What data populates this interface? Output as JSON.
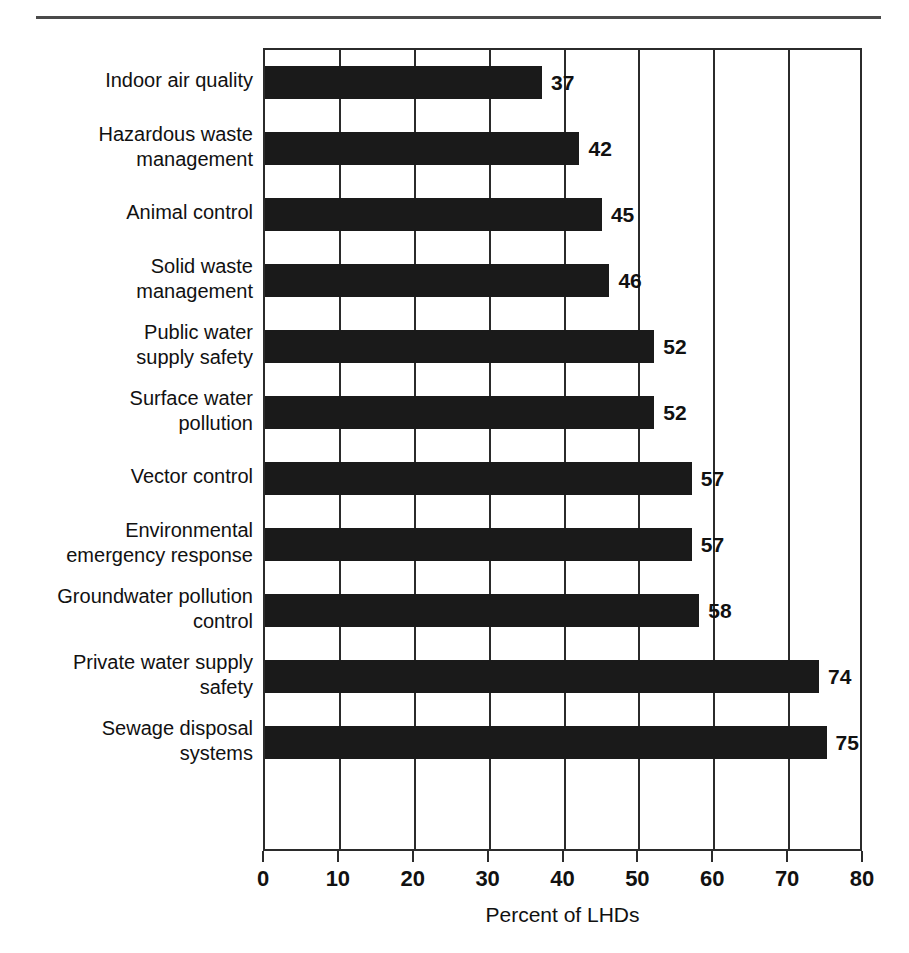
{
  "page": {
    "background_color": "#ffffff",
    "rule_color": "#4a4a4a"
  },
  "chart_data": {
    "type": "bar",
    "orientation": "horizontal",
    "title": "",
    "subtitle": "",
    "xlabel": "Percent of LHDs",
    "ylabel": "",
    "xlim": [
      0,
      80
    ],
    "xticks": [
      0,
      10,
      20,
      30,
      40,
      50,
      60,
      70,
      80
    ],
    "xtick_labels": [
      "0",
      "10",
      "20",
      "30",
      "40",
      "50",
      "60",
      "70",
      "80"
    ],
    "grid": true,
    "grid_axis": "x",
    "legend": false,
    "legend_position": "none",
    "bar_color": "#1a1a1a",
    "axis_color": "#2b2b2b",
    "value_labels": true,
    "categories": [
      "Indoor air quality",
      "Hazardous waste\nmanagement",
      "Animal control",
      "Solid waste\nmanagement",
      "Public water\nsupply safety",
      "Surface water\npollution",
      "Vector control",
      "Environmental\nemergency response",
      "Groundwater pollution\ncontrol",
      "Private water supply\nsafety",
      "Sewage disposal\nsystems"
    ],
    "values": [
      37,
      42,
      45,
      46,
      52,
      52,
      57,
      57,
      58,
      74,
      75
    ],
    "value_label_text": [
      "37",
      "42",
      "45",
      "46",
      "52",
      "52",
      "57",
      "57",
      "58",
      "74",
      "75"
    ]
  }
}
